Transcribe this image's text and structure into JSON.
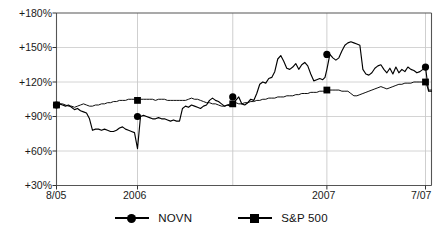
{
  "chart_data": {
    "type": "line",
    "title": "",
    "subtitle": "",
    "xlabel": "",
    "ylabel": "",
    "grid": true,
    "legend_position": "bottom-center",
    "ylim": [
      30,
      180
    ],
    "yticks": [
      30,
      60,
      90,
      120,
      150,
      180
    ],
    "ytick_labels": [
      "+30%",
      "+60%",
      "+90%",
      "+120%",
      "+150%",
      "+180%"
    ],
    "xlim": [
      0,
      100
    ],
    "xticks": [
      0,
      21.6,
      72.1,
      98.4
    ],
    "xtick_labels": [
      "8/05",
      "2006",
      "2007",
      "7/07"
    ],
    "marker_x": [
      0,
      21.6,
      47.0,
      72.1,
      98.4
    ],
    "series": [
      {
        "name": "NOVN",
        "marker": "circle",
        "marker_values": [
          100,
          90,
          107,
          144,
          133
        ],
        "x": [
          0,
          0.8,
          1.6,
          2.4,
          3.2,
          4,
          4.8,
          5.6,
          6.4,
          7.2,
          8,
          8.8,
          9.6,
          10.4,
          11.2,
          12,
          12.8,
          13.6,
          14.4,
          15.2,
          16,
          16.8,
          17.6,
          18.4,
          19.2,
          20,
          20.8,
          21.6,
          22.4,
          23.2,
          24,
          24.8,
          25.6,
          26.4,
          27.2,
          28,
          28.8,
          29.6,
          30.4,
          31.2,
          32,
          32.8,
          33.6,
          34.4,
          35.2,
          36,
          36.8,
          37.6,
          38.4,
          39.2,
          40,
          40.8,
          41.6,
          42.4,
          43.2,
          44,
          44.8,
          45.6,
          46.4,
          47,
          47.8,
          48.6,
          49.4,
          50.2,
          51,
          51.8,
          52.6,
          53.4,
          54.2,
          55,
          55.8,
          56.6,
          57.4,
          58.2,
          59,
          59.8,
          60.6,
          61.4,
          62.2,
          63,
          63.8,
          64.6,
          65.4,
          66.2,
          67,
          67.8,
          68.6,
          69.4,
          70.2,
          71,
          71.6,
          72.1,
          72.9,
          73.7,
          74.5,
          75.3,
          76.1,
          76.9,
          77.7,
          78.5,
          79.3,
          80.1,
          80.9,
          81.7,
          82.5,
          83.3,
          84.1,
          84.9,
          85.7,
          86.5,
          87.3,
          88.1,
          88.9,
          89.7,
          90.5,
          91.3,
          92.1,
          92.9,
          93.7,
          94.5,
          95.3,
          96.1,
          96.9,
          97.7,
          98.4,
          99.2,
          100
        ],
        "values": [
          100,
          101,
          100,
          99,
          100,
          98,
          96,
          97,
          95,
          94,
          93,
          88,
          78,
          79,
          79,
          78,
          79,
          78,
          77,
          77,
          78,
          80,
          81,
          79,
          78,
          77,
          76,
          62,
          90,
          91,
          90,
          89,
          88,
          88,
          89,
          88,
          88,
          87,
          86,
          87,
          86,
          86,
          97,
          99,
          98,
          100,
          99,
          98,
          97,
          99,
          100,
          104,
          106,
          104,
          103,
          101,
          99,
          100,
          99,
          101,
          104,
          107,
          101,
          100,
          102,
          105,
          104,
          110,
          118,
          120,
          119,
          123,
          124,
          129,
          140,
          143,
          138,
          132,
          131,
          133,
          136,
          131,
          135,
          137,
          134,
          127,
          121,
          122,
          123,
          122,
          124,
          131,
          144,
          141,
          139,
          141,
          147,
          152,
          154,
          155,
          154,
          153,
          152,
          131,
          127,
          126,
          128,
          132,
          134,
          135,
          131,
          128,
          132,
          127,
          133,
          128,
          131,
          129,
          133,
          131,
          130,
          128,
          129,
          131,
          133,
          112,
          112
        ]
      },
      {
        "name": "S&P 500",
        "marker": "square",
        "marker_values": [
          100,
          104,
          101,
          113,
          120
        ],
        "x": [
          0,
          0.8,
          1.6,
          2.4,
          3.2,
          4,
          4.8,
          5.6,
          6.4,
          7.2,
          8,
          8.8,
          9.6,
          10.4,
          11.2,
          12,
          12.8,
          13.6,
          14.4,
          15.2,
          16,
          16.8,
          17.6,
          18.4,
          19.2,
          20,
          20.8,
          21.6,
          22.4,
          23.2,
          24,
          24.8,
          25.6,
          26.4,
          27.2,
          28,
          28.8,
          29.6,
          30.4,
          31.2,
          32,
          32.8,
          33.6,
          34.4,
          35.2,
          36,
          36.8,
          37.6,
          38.4,
          39.2,
          40,
          40.8,
          41.6,
          42.4,
          43.2,
          44,
          44.8,
          45.6,
          46.4,
          47,
          47.8,
          48.6,
          49.4,
          50.2,
          51,
          51.8,
          52.6,
          53.4,
          54.2,
          55,
          55.8,
          56.6,
          57.4,
          58.2,
          59,
          59.8,
          60.6,
          61.4,
          62.2,
          63,
          63.8,
          64.6,
          65.4,
          66.2,
          67,
          67.8,
          68.6,
          69.4,
          70.2,
          71,
          71.6,
          72.1,
          72.9,
          73.7,
          74.5,
          75.3,
          76.1,
          76.9,
          77.7,
          78.5,
          79.3,
          80.1,
          80.9,
          81.7,
          82.5,
          83.3,
          84.1,
          84.9,
          85.7,
          86.5,
          87.3,
          88.1,
          88.9,
          89.7,
          90.5,
          91.3,
          92.1,
          92.9,
          93.7,
          94.5,
          95.3,
          96.1,
          96.9,
          97.7,
          98.4,
          99.2,
          100
        ],
        "values": [
          100,
          101,
          101,
          100,
          99,
          99,
          98,
          99,
          100,
          101,
          100,
          99,
          99,
          100,
          100,
          101,
          101,
          102,
          102,
          103,
          103,
          104,
          104,
          104,
          105,
          105,
          105,
          104,
          105,
          105,
          105,
          105,
          105,
          104,
          105,
          105,
          105,
          104,
          104,
          104,
          104,
          104,
          104,
          104,
          105,
          106,
          105,
          105,
          104,
          103,
          102,
          102,
          101,
          101,
          100,
          99,
          99,
          100,
          101,
          101,
          102,
          101,
          101,
          102,
          102,
          103,
          103,
          104,
          104,
          105,
          105,
          106,
          106,
          106,
          107,
          107,
          107,
          108,
          108,
          108,
          109,
          109,
          110,
          110,
          110,
          111,
          111,
          111,
          112,
          112,
          112,
          113,
          113,
          113,
          113,
          113,
          112,
          112,
          112,
          110,
          108,
          108,
          109,
          110,
          111,
          112,
          113,
          114,
          115,
          116,
          115,
          114,
          115,
          116,
          117,
          118,
          118,
          119,
          119,
          119,
          120,
          120,
          120,
          120,
          120,
          113,
          113
        ]
      }
    ]
  },
  "legend": {
    "items": [
      {
        "label": "NOVN",
        "marker": "circle"
      },
      {
        "label": "S&P 500",
        "marker": "square"
      }
    ]
  }
}
